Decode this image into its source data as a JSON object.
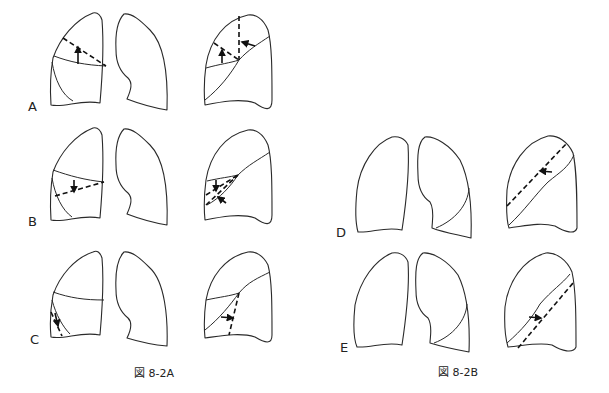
{
  "figure_2A": {
    "caption": "図 8-2A",
    "panels": [
      {
        "label": "A",
        "description": "Right upper lobe collapse: minor fissure shifts upward (frontal), fissures converge (lateral)"
      },
      {
        "label": "B",
        "description": "Right middle lobe collapse: minor fissure shifts downward, fissures converge on lateral view"
      },
      {
        "label": "C",
        "description": "Right lower lobe collapse: major fissure shifts posteriorly"
      }
    ]
  },
  "figure_2B": {
    "caption": "図 8-2B",
    "panels": [
      {
        "label": "D",
        "description": "Left upper lobe collapse: major fissure shifts anteriorly (lateral view)"
      },
      {
        "label": "E",
        "description": "Left lower lobe collapse: major fissure shifts posteriorly (lateral view)"
      }
    ]
  },
  "legend": {
    "solid_line": "collapsed fissure position",
    "dashed_line": "normal fissure position",
    "arrow": "direction of fissure displacement"
  }
}
